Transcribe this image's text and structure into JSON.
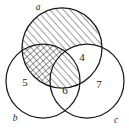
{
  "figure": {
    "type": "venn-diagram",
    "sets": 3,
    "width": 129,
    "height": 129,
    "background_color": "#ffffff",
    "stroke_color": "#1a1a1a"
  },
  "circles": [
    {
      "id": "a",
      "label": "a",
      "cx": 62,
      "cy": 48,
      "r": 40,
      "label_x": 38,
      "label_y": 7,
      "fill_pattern": "diagonal-hatch"
    },
    {
      "id": "b",
      "label": "b",
      "cx": 43,
      "cy": 81,
      "r": 37,
      "label_x": 15,
      "label_y": 119,
      "fill_pattern": "none"
    },
    {
      "id": "c",
      "label": "c",
      "cx": 87,
      "cy": 81,
      "r": 37,
      "label_x": 116,
      "label_y": 121,
      "fill_pattern": "none"
    }
  ],
  "regions": [
    {
      "id": "a-only",
      "sets": "a",
      "value": "",
      "x": 70,
      "y": 26,
      "shading": "diagonal-hatch"
    },
    {
      "id": "b-only",
      "sets": "b",
      "value": "5",
      "x": 25,
      "y": 83,
      "shading": "none"
    },
    {
      "id": "c-only",
      "sets": "c",
      "value": "7",
      "x": 99,
      "y": 85,
      "shading": "none"
    },
    {
      "id": "a-and-b",
      "sets": "a,b",
      "value": "",
      "x": 42,
      "y": 58,
      "shading": "cross-hatch"
    },
    {
      "id": "a-and-c",
      "sets": "a,c",
      "value": "4",
      "x": 82,
      "y": 58,
      "shading": "none"
    },
    {
      "id": "b-and-c",
      "sets": "b,c",
      "value": "6",
      "x": 65,
      "y": 90,
      "shading": "none"
    },
    {
      "id": "a-b-and-c",
      "sets": "a,b,c",
      "value": "",
      "x": 64,
      "y": 68,
      "shading": "diagonal-hatch"
    }
  ],
  "set_labels": {
    "a": "a",
    "b": "b",
    "c": "c"
  },
  "counts": {
    "b_only": "5",
    "a_and_c": "4",
    "b_and_c": "6",
    "c_only": "7"
  }
}
